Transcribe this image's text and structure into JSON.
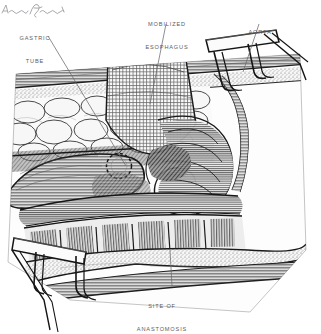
{
  "figure": {
    "medium": "pen-and-ink medical illustration",
    "background_color": "#ffffff",
    "ink_color": "#2b2b2b",
    "label_color": "#5d5d62",
    "width": 321,
    "height": 334
  },
  "labels": [
    {
      "id": "gastric-tube",
      "line1": "GASTRIC",
      "line2": "TUBE",
      "x": 20,
      "y": 20,
      "leader": {
        "x1": 48,
        "y1": 36,
        "x2": 126,
        "y2": 166
      }
    },
    {
      "id": "mobilized-esophagus",
      "line1": "MOBILIZED",
      "line2": "ESOPHAGUS",
      "x": 140,
      "y": 6,
      "leader": {
        "x1": 166,
        "y1": 24,
        "x2": 150,
        "y2": 104
      }
    },
    {
      "id": "aorta",
      "line1": "AORTA",
      "line2": "",
      "x": 240,
      "y": 14,
      "leader": {
        "x1": 259,
        "y1": 24,
        "x2": 243,
        "y2": 72
      }
    },
    {
      "id": "site-of-anastomosis",
      "line1": "SITE OF",
      "line2": "ANASTOMOSIS",
      "x": 128,
      "y": 288,
      "leader": {
        "x1": 172,
        "y1": 286,
        "x2": 170,
        "y2": 250
      }
    }
  ],
  "anatomy": [
    {
      "name": "skin-and-subcutaneous-layer",
      "note": "upper wound edge band"
    },
    {
      "name": "adipose-lobules",
      "note": "cobblestone fat tissue, upper left"
    },
    {
      "name": "gastric-tube",
      "note": "elongated tubular stomach conduit, left"
    },
    {
      "name": "anastomosis-opening",
      "note": "dashed circle on gastric tube"
    },
    {
      "name": "mobilized-esophagus",
      "note": "mesh-textured retracted esophagus, top center"
    },
    {
      "name": "aorta",
      "note": "vessel along right chest wall"
    },
    {
      "name": "intercostal-muscle-blocks",
      "note": "segmented muscle between ribs, lower center"
    },
    {
      "name": "lower-wound-edge",
      "note": "tapering tissue band, lower right"
    }
  ],
  "instruments": [
    {
      "name": "retractor-upper-right",
      "type": "rib retractor",
      "x": 206,
      "y": 30
    },
    {
      "name": "retractor-lower-left",
      "type": "rib retractor",
      "x": 4,
      "y": 228
    }
  ],
  "signature": {
    "name": "artist-signature",
    "text": ""
  }
}
